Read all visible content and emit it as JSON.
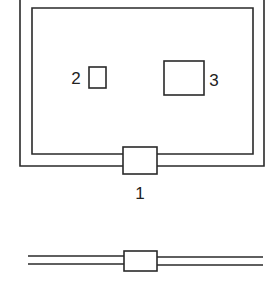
{
  "diagram": {
    "labels": {
      "connector": "1",
      "small_component": "2",
      "large_component": "3"
    },
    "colors": {
      "line": "#2a2a2a",
      "background": "#ffffff"
    }
  }
}
